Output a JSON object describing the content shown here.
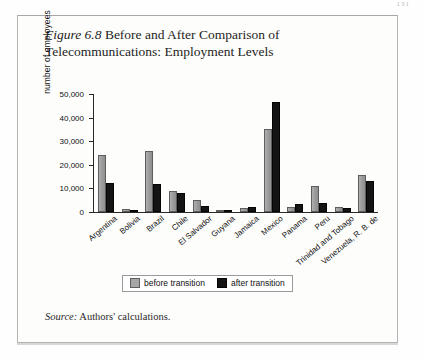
{
  "page": {
    "page_number": "131"
  },
  "figure": {
    "number_label": "Figure 6.8",
    "title_rest": " Before and After Comparison of Telecommunications: Employment Levels",
    "source_label": "Source:",
    "source_text": " Authors' calculations."
  },
  "legend": {
    "items": [
      {
        "label": "before transition",
        "color": "#a6a6a6"
      },
      {
        "label": "after transition",
        "color": "#141414"
      }
    ]
  },
  "chart_data": {
    "type": "bar",
    "title": "Figure 6.8 Before and After Comparison of Telecommunications: Employment Levels",
    "xlabel": "",
    "ylabel": "number of employees",
    "ylim": [
      0,
      50000
    ],
    "yticks": [
      0,
      10000,
      20000,
      30000,
      40000,
      50000
    ],
    "ytick_labels": [
      "0",
      "10,000",
      "20,000",
      "30,000",
      "40,000",
      "50,000"
    ],
    "grid": false,
    "legend_position": "bottom-center",
    "categories": [
      "Argentina",
      "Bolivia",
      "Brazil",
      "Chile",
      "El Salvador",
      "Guyana",
      "Jamaica",
      "Mexico",
      "Panama",
      "Peru",
      "Trinidad and Tobago",
      "Venezuela, R. B. de"
    ],
    "series": [
      {
        "name": "before transition",
        "color": "#a6a6a6",
        "values": [
          24200,
          1200,
          26000,
          9000,
          5000,
          600,
          1800,
          35000,
          2300,
          11000,
          2000,
          15500
        ]
      },
      {
        "name": "after transition",
        "color": "#141414",
        "values": [
          12500,
          800,
          11800,
          8000,
          2500,
          400,
          2300,
          46500,
          3500,
          4000,
          1800,
          13000
        ]
      }
    ]
  }
}
